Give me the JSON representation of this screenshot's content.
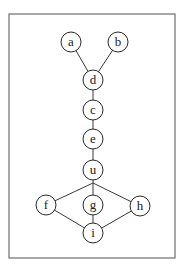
{
  "diagram": {
    "type": "graph",
    "frame": {
      "x": 9,
      "y": 14,
      "width": 166,
      "height": 244
    },
    "node_radius": 10,
    "nodes": [
      {
        "id": "a",
        "label": "a",
        "x": 71,
        "y": 42
      },
      {
        "id": "b",
        "label": "b",
        "x": 118,
        "y": 42
      },
      {
        "id": "d",
        "label": "d",
        "x": 93,
        "y": 80
      },
      {
        "id": "c",
        "label": "c",
        "x": 93,
        "y": 110
      },
      {
        "id": "e",
        "label": "e",
        "x": 93,
        "y": 139
      },
      {
        "id": "u",
        "label": "u",
        "x": 93,
        "y": 170
      },
      {
        "id": "f",
        "label": "f",
        "x": 46,
        "y": 205
      },
      {
        "id": "g",
        "label": "g",
        "x": 93,
        "y": 205
      },
      {
        "id": "h",
        "label": "h",
        "x": 140,
        "y": 206
      },
      {
        "id": "i",
        "label": "i",
        "x": 93,
        "y": 233
      }
    ],
    "edges": [
      {
        "from": "a",
        "to": "d"
      },
      {
        "from": "b",
        "to": "d"
      },
      {
        "from": "d",
        "to": "c"
      },
      {
        "from": "c",
        "to": "e"
      },
      {
        "from": "e",
        "to": "u"
      },
      {
        "from": "u",
        "to": "f",
        "via": [
          93,
          183
        ]
      },
      {
        "from": "u",
        "to": "g"
      },
      {
        "from": "u",
        "to": "h",
        "via": [
          93,
          183
        ]
      },
      {
        "from": "f",
        "to": "i"
      },
      {
        "from": "g",
        "to": "i"
      },
      {
        "from": "h",
        "to": "i"
      }
    ]
  }
}
